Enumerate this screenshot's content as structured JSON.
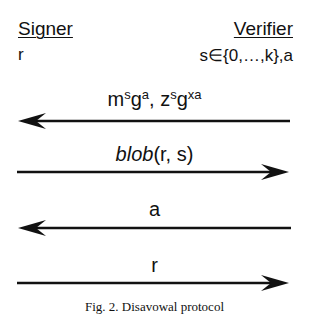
{
  "parties": {
    "left": {
      "name": "Signer",
      "value": "r"
    },
    "right": {
      "name": "Verifier",
      "value": "s∈{0,…,k},a"
    }
  },
  "messages": [
    {
      "direction": "left",
      "label_html_parts": [
        "m",
        "s",
        "g",
        "a",
        ", z",
        "s",
        "g",
        "xa"
      ],
      "label": "m^s g^a, z^s g^xa"
    },
    {
      "direction": "right",
      "label_italic": "blob",
      "label_rest": "(r, s)",
      "label": "blob(r, s)"
    },
    {
      "direction": "left",
      "label": "a"
    },
    {
      "direction": "right",
      "label": "r"
    }
  ],
  "caption": "Fig. 2.  Disavowal protocol",
  "colors": {
    "ink": "#111111",
    "background": "#ffffff"
  }
}
